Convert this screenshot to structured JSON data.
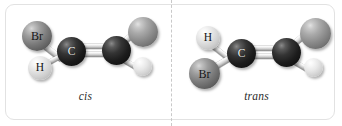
{
  "figure": {
    "background_color": "#ffffff",
    "frame_border_color": "#e2e2e2",
    "divider_color": "#c9c9c9",
    "divider_style": "dashed"
  },
  "panels": [
    {
      "id": "cis",
      "caption": "cis",
      "molecule": {
        "formula_note": "BrHC=CHBr",
        "bond_between_carbons": "double",
        "atoms": [
          {
            "element": "Br",
            "label": "Br",
            "labeled": true,
            "shade": "dark-gray",
            "size_px": 30,
            "position": "upper-left",
            "color": "#7b7b7b"
          },
          {
            "element": "H",
            "label": "H",
            "labeled": true,
            "shade": "near-white",
            "size_px": 24,
            "position": "lower-left",
            "color": "#e4e4e4"
          },
          {
            "element": "C",
            "label": "C",
            "labeled": true,
            "shade": "black",
            "size_px": 29,
            "position": "center-left",
            "color": "#1c1c1c"
          },
          {
            "element": "C",
            "label": "",
            "labeled": false,
            "shade": "black",
            "size_px": 29,
            "position": "center-right",
            "color": "#1c1c1c"
          },
          {
            "element": "Br",
            "label": "",
            "labeled": false,
            "shade": "medium-gray",
            "size_px": 30,
            "position": "upper-right",
            "color": "#8b8b8b"
          },
          {
            "element": "H",
            "label": "",
            "labeled": false,
            "shade": "near-white",
            "size_px": 19,
            "position": "lower-right",
            "color": "#e8e8e8"
          }
        ]
      }
    },
    {
      "id": "trans",
      "caption": "trans",
      "molecule": {
        "formula_note": "BrHC=CHBr",
        "bond_between_carbons": "double",
        "atoms": [
          {
            "element": "H",
            "label": "H",
            "labeled": true,
            "shade": "near-white",
            "size_px": 24,
            "position": "upper-left",
            "color": "#e4e4e4"
          },
          {
            "element": "Br",
            "label": "Br",
            "labeled": true,
            "shade": "dark-gray",
            "size_px": 31,
            "position": "lower-left",
            "color": "#7b7b7b"
          },
          {
            "element": "C",
            "label": "C",
            "labeled": true,
            "shade": "black",
            "size_px": 29,
            "position": "center-left",
            "color": "#1c1c1c"
          },
          {
            "element": "C",
            "label": "",
            "labeled": false,
            "shade": "black",
            "size_px": 29,
            "position": "center-right",
            "color": "#1c1c1c"
          },
          {
            "element": "Br",
            "label": "",
            "labeled": false,
            "shade": "medium-gray",
            "size_px": 31,
            "position": "upper-right",
            "color": "#8b8b8b"
          },
          {
            "element": "H",
            "label": "",
            "labeled": false,
            "shade": "near-white",
            "size_px": 19,
            "position": "lower-right",
            "color": "#e8e8e8"
          }
        ]
      }
    }
  ]
}
